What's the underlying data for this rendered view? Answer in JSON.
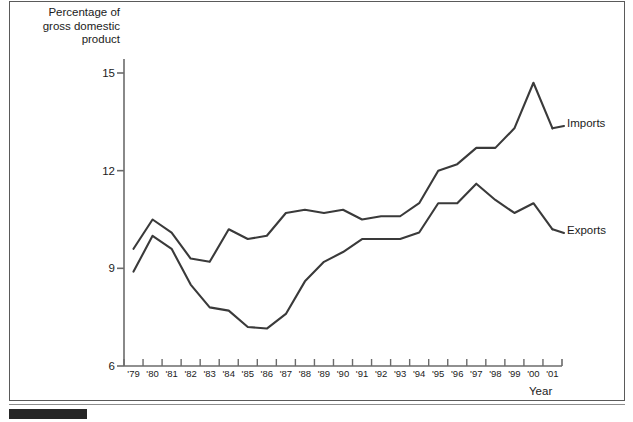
{
  "figure": {
    "y_axis_title": "Percentage of\ngross domestic\nproduct",
    "x_axis_title": "Year",
    "imports_label": "Imports",
    "exports_label": "Exports",
    "line_color": "#3a3a3a",
    "axis_color": "#6b6b6b",
    "frame_color": "#5a5a5a",
    "bar_color": "#262626"
  },
  "chart_data": {
    "type": "line",
    "title": "",
    "xlabel": "Year",
    "ylabel": "Percentage of gross domestic product",
    "categories": [
      "'79",
      "'80",
      "'81",
      "'82",
      "'83",
      "'84",
      "'85",
      "'86",
      "'87",
      "'88",
      "'89",
      "'90",
      "'91",
      "'92",
      "'93",
      "'94",
      "'95",
      "'96",
      "'97",
      "'98",
      "'99",
      "'00",
      "'01"
    ],
    "yticks": [
      6,
      9,
      12,
      15
    ],
    "ylim": [
      6,
      15.6
    ],
    "grid": false,
    "legend": "right-inline",
    "series": [
      {
        "name": "Imports",
        "values": [
          9.6,
          10.5,
          10.1,
          9.3,
          9.2,
          10.2,
          9.9,
          10.0,
          10.7,
          10.8,
          10.7,
          10.8,
          10.5,
          10.6,
          10.6,
          11.0,
          12.0,
          12.2,
          12.7,
          12.7,
          13.3,
          14.7,
          13.3
        ]
      },
      {
        "name": "Exports",
        "values": [
          8.9,
          10.0,
          9.6,
          8.5,
          7.8,
          7.7,
          7.2,
          7.15,
          7.6,
          8.6,
          9.2,
          9.5,
          9.9,
          9.9,
          9.9,
          10.1,
          11.0,
          11.0,
          11.6,
          11.1,
          10.7,
          11.0,
          10.2
        ]
      }
    ]
  }
}
